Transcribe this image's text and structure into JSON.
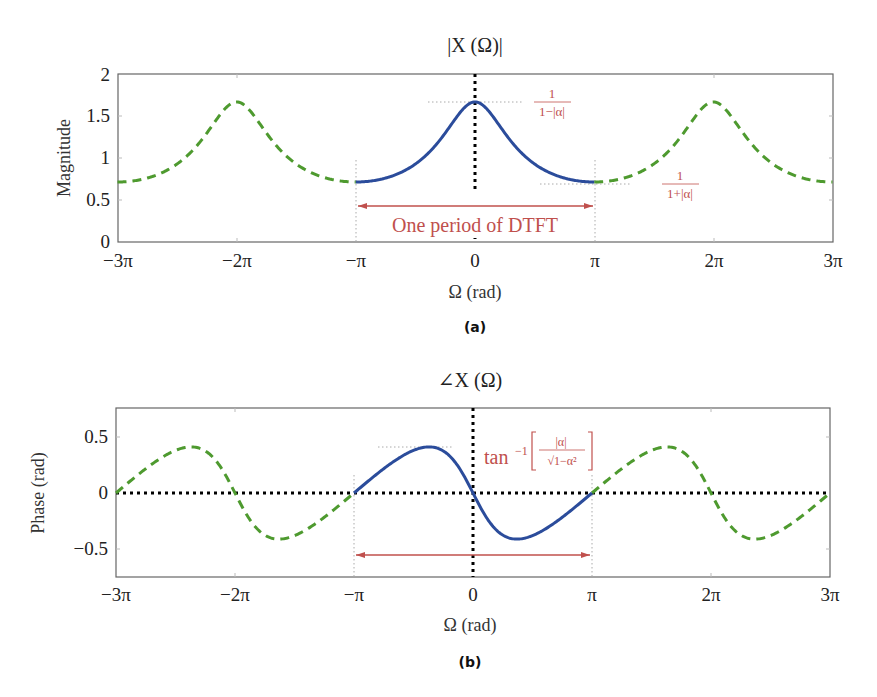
{
  "figure": {
    "colors": {
      "period_curve": "#2b4c9b",
      "periodic_extension": "#4e9a2f",
      "annotation": "#c0504d",
      "axis": "#555555",
      "dotted_guides": "#000000"
    },
    "alpha": 0.4
  },
  "chart_data": [
    {
      "id": "a",
      "type": "line",
      "title": "|X (Ω)|",
      "caption": "(a)",
      "xlabel": "Ω (rad)",
      "ylabel": "Magnitude",
      "xlim_pi": [
        -3,
        3
      ],
      "ylim": [
        0,
        2
      ],
      "x_ticks": [
        "−3π",
        "−2π",
        "−π",
        "0",
        "π",
        "2π",
        "3π"
      ],
      "y_ticks": [
        "0",
        "0.5",
        "1",
        "1.5",
        "2"
      ],
      "grid": false,
      "series": [
        {
          "name": "One period (−π to π)",
          "style": "solid",
          "color": "#2b4c9b",
          "x_pi": [
            -1,
            -0.75,
            -0.5,
            -0.25,
            0,
            0.25,
            0.5,
            0.75,
            1
          ],
          "values": [
            0.714,
            0.778,
            0.928,
            1.253,
            1.667,
            1.253,
            0.928,
            0.778,
            0.714
          ]
        },
        {
          "name": "Periodic extension",
          "style": "dashed",
          "color": "#4e9a2f",
          "x_pi": [
            -3,
            -2.5,
            -2,
            -1.5,
            -1,
            1,
            1.5,
            2,
            2.5,
            3
          ],
          "values": [
            0.714,
            0.928,
            1.667,
            0.928,
            0.714,
            0.714,
            0.928,
            1.667,
            0.928,
            0.714
          ]
        }
      ],
      "annotations": [
        {
          "text_num": "1",
          "text_den": "1−|α|",
          "meaning": "peak value 1/(1−|α|)",
          "value": 1.667
        },
        {
          "text_num": "1",
          "text_den": "1+|α|",
          "meaning": "minimum value 1/(1+|α|)",
          "value": 0.714
        },
        {
          "text": "One period of DTFT",
          "type": "double-arrow",
          "from_pi": -1,
          "to_pi": 1
        }
      ]
    },
    {
      "id": "b",
      "type": "line",
      "title": "∠X (Ω)",
      "caption": "(b)",
      "xlabel": "Ω (rad)",
      "ylabel": "Phase (rad)",
      "xlim_pi": [
        -3,
        3
      ],
      "ylim": [
        -0.75,
        0.75
      ],
      "x_ticks": [
        "−3π",
        "−2π",
        "−π",
        "0",
        "π",
        "2π",
        "3π"
      ],
      "y_ticks": [
        "−0.5",
        "0",
        "0.5"
      ],
      "grid": false,
      "series": [
        {
          "name": "One period (−π to π)",
          "style": "solid",
          "color": "#2b4c9b",
          "x_pi": [
            -1,
            -0.75,
            -0.5,
            -0.37,
            -0.25,
            0,
            0.25,
            0.37,
            0.5,
            0.75,
            1
          ],
          "values": [
            0,
            0.215,
            0.381,
            0.412,
            0.398,
            0,
            -0.398,
            -0.412,
            -0.381,
            -0.215,
            0
          ]
        },
        {
          "name": "Periodic extension",
          "style": "dashed",
          "color": "#4e9a2f",
          "x_pi": [
            -3,
            -2.37,
            -2,
            -1.63,
            -1,
            1,
            1.63,
            2,
            2.37,
            3
          ],
          "values": [
            0,
            0.412,
            0,
            -0.412,
            0,
            0,
            0.412,
            0,
            -0.412,
            0
          ]
        }
      ],
      "annotations": [
        {
          "text_prefix": "tan",
          "text_sup": "−1",
          "text_num": "|α|",
          "text_den": "√1−α²",
          "meaning": "peak phase tan⁻¹[|α|/√(1−α²)]",
          "value": 0.412
        },
        {
          "text": "",
          "type": "double-arrow",
          "from_pi": -1,
          "to_pi": 1
        }
      ]
    }
  ]
}
